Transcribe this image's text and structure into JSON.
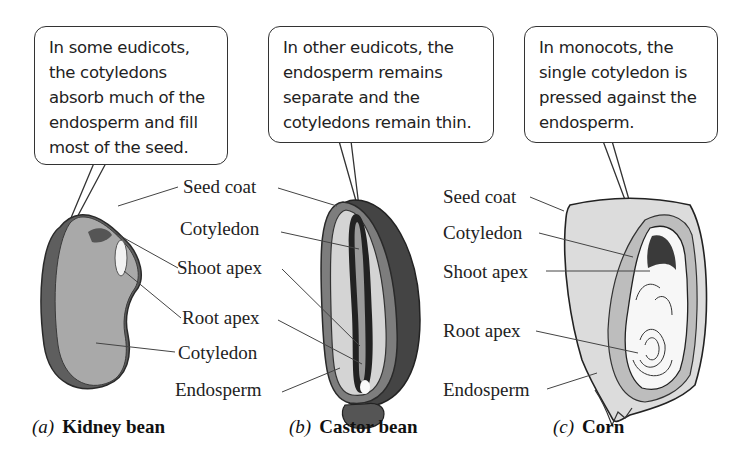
{
  "panels": [
    {
      "id": "a",
      "callout": "In some eudicots,\nthe cotyledons\nabsorb much of the\nendosperm and fill\nmost of the seed.",
      "labels": [
        "Seed coat",
        "Shoot apex",
        "Root apex",
        "Cotyledon"
      ],
      "caption_letter": "(a)",
      "caption_name": "Kidney bean"
    },
    {
      "id": "b",
      "callout": "In other eudicots, the\nendosperm remains\nseparate and the\ncotyledons remain thin.",
      "labels": [
        "Seed coat",
        "Cotyledon",
        "Shoot apex",
        "Root apex",
        "Cotyledon",
        "Endosperm"
      ],
      "caption_letter": "(b)",
      "caption_name": "Castor bean"
    },
    {
      "id": "c",
      "callout": "In monocots, the\nsingle cotyledon is\npressed against the\nendosperm.",
      "labels": [
        "Seed coat",
        "Cotyledon",
        "Shoot apex",
        "Root apex",
        "Endosperm"
      ],
      "caption_letter": "(c)",
      "caption_name": "Corn"
    }
  ],
  "colors": {
    "outline": "#333333",
    "seed_dark": "#3a3a3a",
    "seed_mid": "#8c8c8c",
    "seed_light": "#a8a8a8",
    "endosperm": "#d6d6d6",
    "corn_fill": "#dcdcdc",
    "corn_embryo": "#bdbdbd"
  }
}
